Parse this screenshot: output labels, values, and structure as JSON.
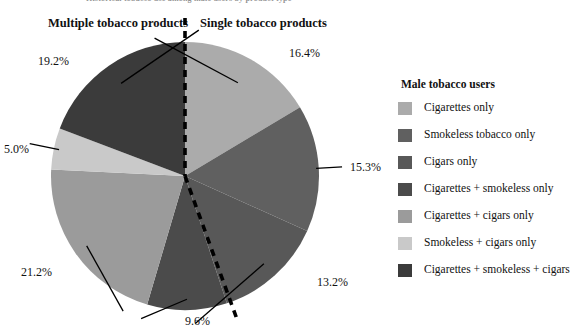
{
  "top_caption": "Historical tobacco use among male users by product type",
  "groups": {
    "multiple_label": "Multiple tobacco products",
    "single_label": "Single tobacco products"
  },
  "legend": {
    "title": "Male tobacco users",
    "items": [
      {
        "label": "Cigarettes only",
        "color": "#ababab"
      },
      {
        "label": "Smokeless tobacco only",
        "color": "#606060"
      },
      {
        "label": "Cigars only",
        "color": "#585858"
      },
      {
        "label": "Cigarettes + smokeless only",
        "color": "#4b4b4b"
      },
      {
        "label": "Cigarettes + cigars only",
        "color": "#9b9b9b"
      },
      {
        "label": "Smokeless + cigars only",
        "color": "#c9c9c9"
      },
      {
        "label": "Cigarettes + smokeless + cigars",
        "color": "#3b3b3b"
      }
    ]
  },
  "divider": {
    "style": "dashed",
    "color": "#000000",
    "note": "separates single from multiple tobacco product groups"
  },
  "chart_data": {
    "type": "pie",
    "title": "Male tobacco users",
    "start_angle_deg": 0,
    "direction": "clockwise",
    "units": "percent",
    "categories": [
      "Cigarettes only",
      "Smokeless tobacco only",
      "Cigars only",
      "Cigarettes + smokeless only",
      "Cigarettes + cigars only",
      "Smokeless + cigars only",
      "Cigarettes + smokeless + cigars"
    ],
    "values": [
      16.4,
      15.3,
      13.2,
      9.6,
      21.2,
      5.0,
      19.2
    ],
    "labels": [
      "16.4%",
      "15.3%",
      "13.2%",
      "9.6%",
      "21.2%",
      "5.0%",
      "19.2%"
    ],
    "colors": [
      "#ababab",
      "#606060",
      "#585858",
      "#4b4b4b",
      "#9b9b9b",
      "#c9c9c9",
      "#3b3b3b"
    ],
    "groups": {
      "Single tobacco products": [
        "Cigarettes only",
        "Smokeless tobacco only",
        "Cigars only"
      ],
      "Multiple tobacco products": [
        "Cigarettes + smokeless only",
        "Cigarettes + cigars only",
        "Smokeless + cigars only",
        "Cigarettes + smokeless + cigars"
      ]
    },
    "group_totals": {
      "Single tobacco products": 44.9,
      "Multiple tobacco products": 55.0
    },
    "legend_position": "right",
    "grid": false
  }
}
